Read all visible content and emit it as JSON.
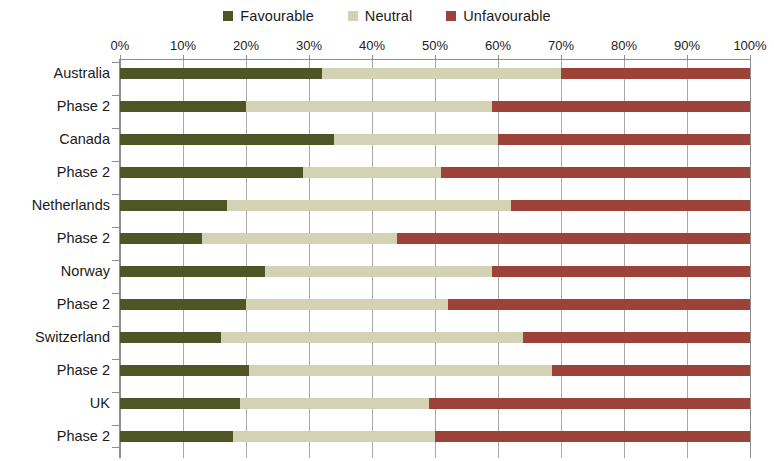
{
  "legend": {
    "position": "top-center",
    "entries": [
      {
        "label": "Favourable",
        "color": "#4e5626",
        "icon": "square-swatch"
      },
      {
        "label": "Neutral",
        "color": "#d4d2b4",
        "icon": "square-swatch"
      },
      {
        "label": "Unfavourable",
        "color": "#9c4238",
        "icon": "square-swatch"
      }
    ]
  },
  "chart_data": {
    "type": "bar",
    "orientation": "horizontal",
    "stacked": true,
    "stack_mode": "percent",
    "title": "",
    "subtitle": "",
    "xlabel": "",
    "ylabel": "",
    "xlim": [
      0,
      100
    ],
    "xticks": [
      0,
      10,
      20,
      30,
      40,
      50,
      60,
      70,
      80,
      90,
      100
    ],
    "xtick_labels": [
      "0%",
      "10%",
      "20%",
      "30%",
      "40%",
      "50%",
      "60%",
      "70%",
      "80%",
      "90%",
      "100%"
    ],
    "axis_position": "top",
    "grid": "vertical",
    "categories": [
      "Australia",
      "Phase 2",
      "Canada",
      "Phase 2",
      "Netherlands",
      "Phase 2",
      "Norway",
      "Phase 2",
      "Switzerland",
      "Phase 2",
      "UK",
      "Phase 2"
    ],
    "groups": [
      "Australia",
      "Canada",
      "Netherlands",
      "Norway",
      "Switzerland",
      "UK"
    ],
    "series": [
      {
        "name": "Favourable",
        "color": "#4e5626",
        "values": [
          32,
          20,
          34,
          29,
          17,
          13,
          23,
          20,
          16,
          20.5,
          19,
          18
        ]
      },
      {
        "name": "Neutral",
        "color": "#d4d2b4",
        "values": [
          38,
          39,
          26,
          22,
          45,
          31,
          36,
          32,
          48,
          48,
          30,
          32
        ]
      },
      {
        "name": "Unfavourable",
        "color": "#9c4238",
        "values": [
          30,
          41,
          40,
          49,
          38,
          56,
          41,
          48,
          36,
          31.5,
          51,
          50
        ]
      }
    ],
    "rows": [
      {
        "group": "Australia",
        "label": "Australia",
        "favourable": 32,
        "neutral": 38,
        "unfavourable": 30
      },
      {
        "group": "Australia",
        "label": "Phase 2",
        "favourable": 20,
        "neutral": 39,
        "unfavourable": 41
      },
      {
        "group": "Canada",
        "label": "Canada",
        "favourable": 34,
        "neutral": 26,
        "unfavourable": 40
      },
      {
        "group": "Canada",
        "label": "Phase 2",
        "favourable": 29,
        "neutral": 22,
        "unfavourable": 49
      },
      {
        "group": "Netherlands",
        "label": "Netherlands",
        "favourable": 17,
        "neutral": 45,
        "unfavourable": 38
      },
      {
        "group": "Netherlands",
        "label": "Phase 2",
        "favourable": 13,
        "neutral": 31,
        "unfavourable": 56
      },
      {
        "group": "Norway",
        "label": "Norway",
        "favourable": 23,
        "neutral": 36,
        "unfavourable": 41
      },
      {
        "group": "Norway",
        "label": "Phase 2",
        "favourable": 20,
        "neutral": 32,
        "unfavourable": 48
      },
      {
        "group": "Switzerland",
        "label": "Switzerland",
        "favourable": 16,
        "neutral": 48,
        "unfavourable": 36
      },
      {
        "group": "Switzerland",
        "label": "Phase 2",
        "favourable": 20.5,
        "neutral": 48,
        "unfavourable": 31.5
      },
      {
        "group": "UK",
        "label": "UK",
        "favourable": 19,
        "neutral": 30,
        "unfavourable": 51
      },
      {
        "group": "UK",
        "label": "Phase 2",
        "favourable": 18,
        "neutral": 32,
        "unfavourable": 50
      }
    ]
  },
  "layout": {
    "plot_left": 120,
    "plot_top": 60,
    "plot_width": 630,
    "plot_height": 398,
    "bar_height": 11,
    "row_pitch": 33,
    "group_pitch": 66,
    "first_bar_top": 8,
    "grid_color": "#a8a8a8",
    "axis_color": "#8d8d8d",
    "background": "#ffffff"
  }
}
